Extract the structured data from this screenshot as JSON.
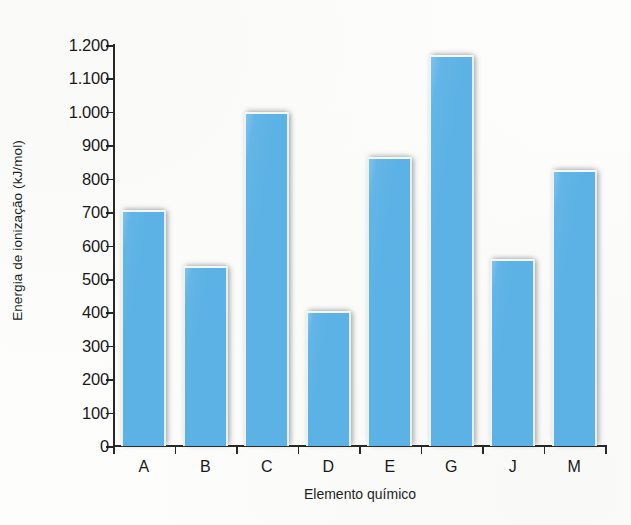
{
  "chart_data": {
    "type": "bar",
    "title": "",
    "subtitle": "",
    "xlabel": "Elemento químico",
    "ylabel": "Energia de ionização (kJ/mol)",
    "categories": [
      "A",
      "B",
      "C",
      "D",
      "E",
      "G",
      "J",
      "M"
    ],
    "values": [
      705,
      540,
      1000,
      405,
      865,
      1170,
      560,
      825
    ],
    "ylim": [
      0,
      1200
    ],
    "ytick_step": 100,
    "ytick_labels": [
      "0",
      "100",
      "200",
      "300",
      "400",
      "500",
      "600",
      "700",
      "800",
      "900",
      "1.000",
      "1.100",
      "1.200"
    ],
    "ytick_values": [
      0,
      100,
      200,
      300,
      400,
      500,
      600,
      700,
      800,
      900,
      1000,
      1100,
      1200
    ],
    "grid": false,
    "legend": false,
    "legend_position": "none",
    "series": [
      {
        "name": "Energia de ionização",
        "values": [
          705,
          540,
          1000,
          405,
          865,
          1170,
          560,
          825
        ]
      }
    ],
    "bar_color": "#5cb2e5",
    "axis_color": "#2a2826",
    "text_color": "#19191a"
  }
}
